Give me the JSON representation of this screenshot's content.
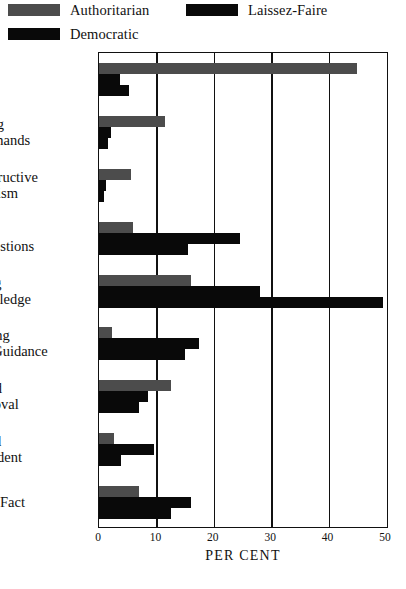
{
  "legend": {
    "items": [
      {
        "label": "Authoritarian",
        "color": "#4c4c4c",
        "key": "authoritarian"
      },
      {
        "label": "Laissez-Faire",
        "color": "#090909",
        "key": "laissez"
      },
      {
        "label": "Democratic",
        "color": "#090909",
        "key": "democratic"
      }
    ]
  },
  "axis": {
    "title": "PER CENT",
    "ticks": [
      "0",
      "10",
      "20",
      "30",
      "40",
      "50"
    ]
  },
  "chart_data": {
    "type": "bar",
    "orientation": "horizontal",
    "title": "",
    "xlabel": "PER CENT",
    "ylabel": "",
    "xlim": [
      0,
      50
    ],
    "xticks": [
      0,
      10,
      20,
      30,
      40,
      50
    ],
    "grid": true,
    "legend_position": "top",
    "categories": [
      "Orders",
      "Disrupting\nCommands",
      "Nonconstructive\nCriticism",
      "Guiding\nSuggestions",
      "Extending\nKnowledge",
      "Stimulating\nSelf-Guidance",
      "Praise and\nApproval",
      "Jovial and\nConfident",
      "Matter of Fact"
    ],
    "series": [
      {
        "name": "Authoritarian",
        "color": "#4c4c4c",
        "values": [
          45.0,
          11.5,
          5.5,
          6.0,
          16.0,
          2.3,
          12.5,
          2.7,
          7.0
        ]
      },
      {
        "name": "Laissez-Faire",
        "color": "#090909",
        "values": [
          3.7,
          2.1,
          1.3,
          24.5,
          28.0,
          17.5,
          8.5,
          9.5,
          16.0
        ]
      },
      {
        "name": "Democratic",
        "color": "#090909",
        "values": [
          5.2,
          1.6,
          0.8,
          15.5,
          49.5,
          15.0,
          7.0,
          3.8,
          12.5
        ]
      }
    ]
  },
  "category_lines": [
    [
      "Orders",
      ""
    ],
    [
      "Disrupting",
      "Commands"
    ],
    [
      "Nonconstructive",
      "Criticism"
    ],
    [
      "Guiding",
      "Suggestions"
    ],
    [
      "Extending",
      "Knowledge"
    ],
    [
      "Stimulating",
      "Self-Guidance"
    ],
    [
      "Praise and",
      "Approval"
    ],
    [
      "Jovial and",
      "Confident"
    ],
    [
      "Matter of Fact",
      ""
    ]
  ]
}
